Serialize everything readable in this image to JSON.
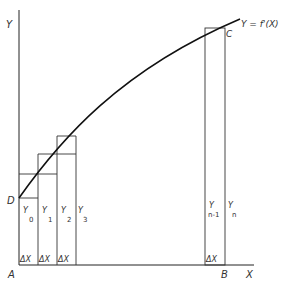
{
  "diagram": {
    "type": "area-under-curve-rectangles",
    "axes": {
      "y_label": "Y",
      "x_label": "X",
      "origin_label": "A",
      "end_label": "B"
    },
    "curve": {
      "label": "Y = f'(X)",
      "start_point_label": "D",
      "end_point_label": "C"
    },
    "strip_labels": {
      "y0": {
        "main": "Y",
        "sub": "0"
      },
      "y1": {
        "main": "Y",
        "sub": "1"
      },
      "y2": {
        "main": "Y",
        "sub": "2"
      },
      "y3": {
        "main": "Y",
        "sub": "3"
      },
      "yn1": {
        "main": "Y",
        "sub": "n-1"
      },
      "yn": {
        "main": "Y",
        "sub": "n"
      }
    },
    "delta": {
      "d1": "ΔX",
      "d2": "ΔX",
      "d3": "ΔX",
      "dn": "ΔX"
    },
    "colors": {
      "ink": "#222222",
      "background": "#ffffff"
    }
  }
}
